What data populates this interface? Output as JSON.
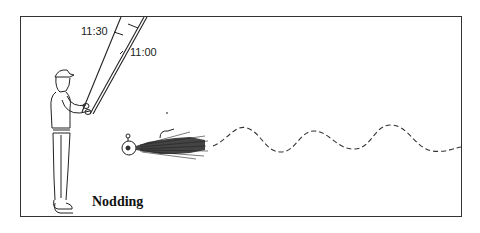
{
  "figure": {
    "caption": "Nodding",
    "angle_labels": {
      "upper": "11:30",
      "lower": "11:00"
    },
    "elements": [
      "angler-with-cap",
      "fishing-rod-at-11:30",
      "fishing-rod-at-11:00",
      "hair-jig-lure",
      "dashed-wavy-retrieve-path"
    ],
    "colors": {
      "line": "#333333",
      "background": "#ffffff"
    }
  }
}
